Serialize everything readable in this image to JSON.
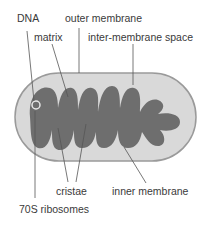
{
  "diagram": {
    "labels": {
      "dna": "DNA",
      "outer_membrane": "outer membrane",
      "matrix": "matrix",
      "inter_membrane_space": "inter-membrane space",
      "cristae": "cristae",
      "inner_membrane": "inner membrane",
      "ribosomes": "70S ribosomes"
    },
    "colors": {
      "outer_fill": "#d9d9d9",
      "outer_stroke": "#9a9a9a",
      "matrix_fill": "#6e6e6e",
      "leader_line": "#555555",
      "text": "#3a3a3a"
    }
  }
}
